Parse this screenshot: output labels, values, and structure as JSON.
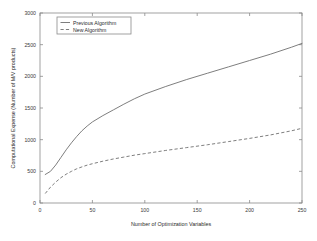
{
  "chart_data": {
    "type": "line",
    "title": "",
    "xlabel": "Number of Optimization Variables",
    "ylabel": "Computational Expense (Number of M/V products)",
    "xlim": [
      0,
      250
    ],
    "ylim": [
      0,
      3000
    ],
    "xticks": [
      0,
      50,
      100,
      150,
      200,
      250
    ],
    "yticks": [
      0,
      500,
      1000,
      1500,
      2000,
      2500,
      3000
    ],
    "xtick_labels": [
      "0",
      "50",
      "100",
      "150",
      "200",
      "250"
    ],
    "ytick_labels": [
      "0",
      "500",
      "1000",
      "1500",
      "2000",
      "2500",
      "3000"
    ],
    "grid": false,
    "legend_position": "upper-left-inside",
    "series": [
      {
        "name": "Previous Algorithm",
        "style": "solid",
        "color": "#6f6f6f",
        "x": [
          5,
          10,
          15,
          20,
          25,
          30,
          35,
          40,
          45,
          50,
          60,
          70,
          80,
          90,
          100,
          120,
          140,
          160,
          180,
          200,
          220,
          240,
          250
        ],
        "values": [
          450,
          500,
          600,
          720,
          840,
          950,
          1050,
          1140,
          1215,
          1280,
          1380,
          1470,
          1560,
          1645,
          1720,
          1840,
          1950,
          2050,
          2150,
          2250,
          2350,
          2460,
          2520
        ]
      },
      {
        "name": "New Algorithm",
        "style": "dashed",
        "color": "#6f6f6f",
        "x": [
          5,
          10,
          15,
          20,
          25,
          30,
          35,
          40,
          45,
          50,
          60,
          70,
          80,
          90,
          100,
          120,
          140,
          160,
          180,
          200,
          220,
          240,
          250
        ],
        "values": [
          150,
          250,
          330,
          400,
          455,
          500,
          540,
          570,
          598,
          620,
          660,
          695,
          725,
          755,
          780,
          830,
          875,
          920,
          970,
          1020,
          1075,
          1140,
          1180
        ]
      }
    ]
  },
  "legend": {
    "entries": [
      {
        "label": "Previous Algorithm"
      },
      {
        "label": "New Algorithm"
      }
    ]
  },
  "axes": {
    "x_title": "Number of Optimization Variables",
    "y_title": "Computational Expense (Number of M/V products)"
  }
}
